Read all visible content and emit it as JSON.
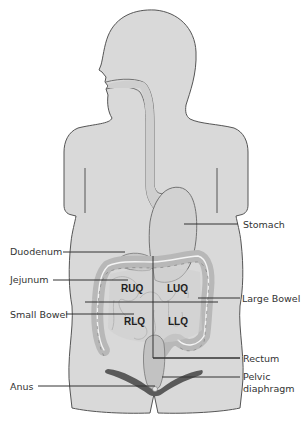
{
  "labels": {
    "stomach": "Stomach",
    "duodenum": "Duodenum",
    "jejunum": "Jejunum",
    "large_bowel": "Large Bowel",
    "small_bowel": "Small Bowel",
    "rectum": "Rectum",
    "anus": "Anus",
    "pelvic_diaphragm_line1": "Pelvic",
    "pelvic_diaphragm_line2": "diaphragm"
  },
  "quadrants": {
    "ruq": "RUQ",
    "luq": "LUQ",
    "rlq": "RLQ",
    "llq": "LLQ"
  },
  "colors": {
    "body_fill": "#d9d9d9",
    "body_outline": "#555555",
    "organ_fill": "#cfcfcf",
    "bowel_fill": "#c4c4c4",
    "bowel_highlight": "#f4f4f4",
    "pelvic_muscle": "#5a5a5a",
    "leader_line": "#333333"
  }
}
